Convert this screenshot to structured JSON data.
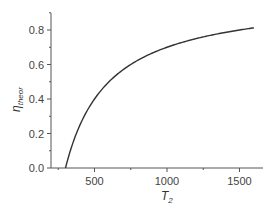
{
  "chart_data": {
    "type": "line",
    "title": "",
    "xlabel": "T2",
    "xlabel_main": "T",
    "xlabel_sub": "2",
    "ylabel": "η_theor",
    "ylabel_main": "η",
    "ylabel_sub": "theor",
    "xlim": [
      280,
      1650
    ],
    "ylim": [
      0,
      0.9
    ],
    "x_ticks": [
      500,
      1000,
      1500
    ],
    "x_tick_labels": [
      "500",
      "1000",
      "1500"
    ],
    "y_ticks": [
      0.0,
      0.2,
      0.4,
      0.6,
      0.8
    ],
    "y_tick_labels": [
      "0.0",
      "0.2",
      "0.4",
      "0.6",
      "0.8"
    ],
    "grid": false,
    "legend": null,
    "series": [
      {
        "name": "η_theor = 1 - 300/T2",
        "color": "#333333",
        "x": [
          300,
          350,
          400,
          450,
          500,
          600,
          700,
          800,
          900,
          1000,
          1100,
          1200,
          1300,
          1400,
          1500,
          1600
        ],
        "y": [
          0.0,
          0.143,
          0.25,
          0.333,
          0.4,
          0.5,
          0.571,
          0.625,
          0.667,
          0.7,
          0.727,
          0.75,
          0.769,
          0.786,
          0.8,
          0.8125
        ]
      }
    ]
  }
}
